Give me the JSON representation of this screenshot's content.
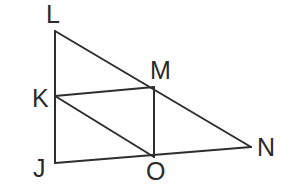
{
  "figure": {
    "stroke_color": "#2e2e2e",
    "points": {
      "L": {
        "x": 55,
        "y": 31
      },
      "K": {
        "x": 55,
        "y": 96
      },
      "J": {
        "x": 55,
        "y": 163
      },
      "M": {
        "x": 154,
        "y": 87
      },
      "O": {
        "x": 154,
        "y": 157
      },
      "N": {
        "x": 251,
        "y": 147
      }
    },
    "segments": [
      [
        "L",
        "J"
      ],
      [
        "L",
        "N"
      ],
      [
        "J",
        "N"
      ],
      [
        "K",
        "M"
      ],
      [
        "K",
        "O"
      ],
      [
        "M",
        "O"
      ]
    ],
    "labels": {
      "L": "L",
      "K": "K",
      "J": "J",
      "M": "M",
      "O": "O",
      "N": "N"
    }
  }
}
